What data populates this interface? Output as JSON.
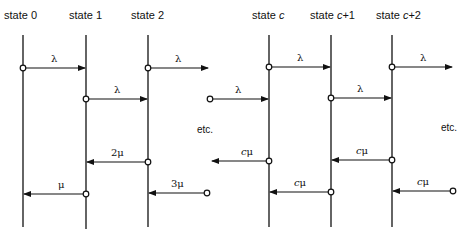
{
  "diagram": {
    "type": "state-transition-timeline",
    "states": [
      {
        "id": "s0",
        "label_prefix": "state",
        "label_value": "0",
        "italic_c": false,
        "x": 23
      },
      {
        "id": "s1",
        "label_prefix": "state",
        "label_value": "1",
        "italic_c": false,
        "x": 86
      },
      {
        "id": "s2",
        "label_prefix": "state",
        "label_value": "2",
        "italic_c": false,
        "x": 148
      },
      {
        "id": "sc",
        "label_prefix": "state",
        "label_value": "c",
        "italic_c": true,
        "x": 269
      },
      {
        "id": "sc1",
        "label_prefix": "state",
        "label_value": "c+1",
        "italic_c": true,
        "x": 331
      },
      {
        "id": "sc2",
        "label_prefix": "state",
        "label_value": "c+2",
        "italic_c": true,
        "x": 392
      }
    ],
    "forward_transitions": [
      {
        "from": "state 0",
        "to": "state 1",
        "rate": "λ"
      },
      {
        "from": "state 1",
        "to": "state 2",
        "rate": "λ"
      },
      {
        "from": "state 2",
        "to": "etc.",
        "rate": "λ"
      },
      {
        "from": "etc.",
        "to": "state c",
        "rate": "λ"
      },
      {
        "from": "state c",
        "to": "state c+1",
        "rate": "λ"
      },
      {
        "from": "state c+1",
        "to": "state c+2",
        "rate": "λ"
      },
      {
        "from": "state c+2",
        "to": "etc.",
        "rate": "λ"
      }
    ],
    "backward_transitions": [
      {
        "from": "state 1",
        "to": "state 0",
        "rate": "μ"
      },
      {
        "from": "state 2",
        "to": "state 1",
        "rate": "2μ"
      },
      {
        "from": "etc.",
        "to": "state 2",
        "rate": "3μ"
      },
      {
        "from": "state c",
        "to": "etc.",
        "rate": "cμ"
      },
      {
        "from": "state c+1",
        "to": "state c",
        "rate": "cμ"
      },
      {
        "from": "state c+2",
        "to": "state c+1",
        "rate": "cμ"
      },
      {
        "from": "etc.",
        "to": "state c+2",
        "rate": "cμ"
      }
    ],
    "ellipsis_labels": [
      "etc.",
      "etc."
    ]
  },
  "labels": {
    "state0": "state  0",
    "state1": "state  1",
    "state2": "state  2",
    "statec_prefix": "state  ",
    "statec": "c",
    "statec1_prefix": "state ",
    "statec1": "c",
    "statec1_suffix": "+1",
    "statec2_prefix": "state ",
    "statec2": "c",
    "statec2_suffix": "+2",
    "lambda": "λ",
    "mu": "μ",
    "two_mu": "2μ",
    "three_mu": "3μ",
    "c": "c",
    "etc": "etc."
  }
}
